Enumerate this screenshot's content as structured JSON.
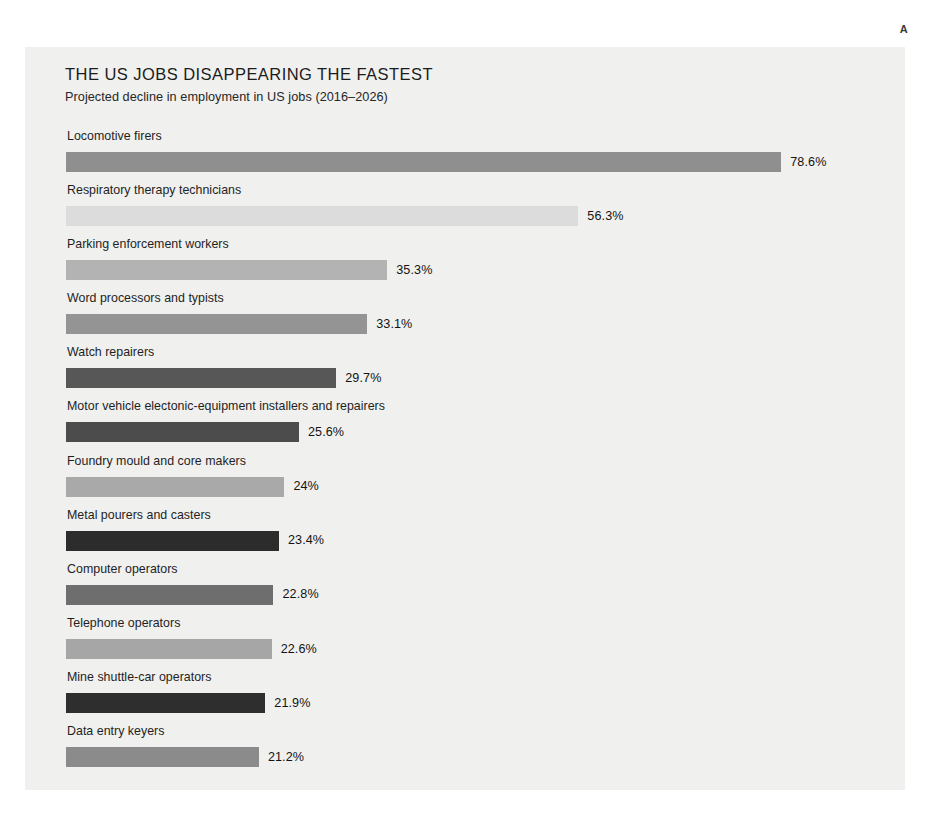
{
  "corner_marker": "A",
  "chart_data": {
    "type": "bar",
    "orientation": "horizontal",
    "title": "THE US JOBS DISAPPEARING THE FASTEST",
    "subtitle": "Projected decline in employment in US jobs (2016–2026)",
    "xlabel": "",
    "ylabel": "",
    "grid": false,
    "legend": "none",
    "value_suffix": "%",
    "xlim": [
      0,
      78.6
    ],
    "categories": [
      "Locomotive firers",
      "Respiratory therapy technicians",
      "Parking enforcement workers",
      "Word processors and typists",
      "Watch repairers",
      "Motor vehicle electonic-equipment installers and repairers",
      "Foundry mould and core makers",
      "Metal pourers and casters",
      "Computer operators",
      "Telephone operators",
      "Mine shuttle-car operators",
      "Data entry keyers"
    ],
    "values": [
      78.6,
      56.3,
      35.3,
      33.1,
      29.7,
      25.6,
      24,
      23.4,
      22.8,
      22.6,
      21.9,
      21.2
    ],
    "value_labels": [
      "78.6%",
      "56.3%",
      "35.3%",
      "33.1%",
      "29.7%",
      "25.6%",
      "24%",
      "23.4%",
      "22.8%",
      "22.6%",
      "21.9%",
      "21.2%"
    ],
    "bar_colors": [
      "#8f8f8f",
      "#dcdcdc",
      "#b3b3b3",
      "#949494",
      "#575757",
      "#4c4c4c",
      "#a9a9a9",
      "#2c2c2c",
      "#6e6e6e",
      "#a6a6a6",
      "#2e2e2e",
      "#8b8b8b"
    ],
    "bars": [
      {
        "label": "Locomotive firers",
        "value": 78.6,
        "value_label": "78.6%",
        "color": "#8f8f8f"
      },
      {
        "label": "Respiratory therapy technicians",
        "value": 56.3,
        "value_label": "56.3%",
        "color": "#dcdcdc"
      },
      {
        "label": "Parking enforcement workers",
        "value": 35.3,
        "value_label": "35.3%",
        "color": "#b3b3b3"
      },
      {
        "label": "Word processors and typists",
        "value": 33.1,
        "value_label": "33.1%",
        "color": "#949494"
      },
      {
        "label": "Watch repairers",
        "value": 29.7,
        "value_label": "29.7%",
        "color": "#575757"
      },
      {
        "label": "Motor vehicle electonic-equipment installers and repairers",
        "value": 25.6,
        "value_label": "25.6%",
        "color": "#4c4c4c"
      },
      {
        "label": "Foundry mould and core makers",
        "value": 24,
        "value_label": "24%",
        "color": "#a9a9a9"
      },
      {
        "label": "Metal pourers and casters",
        "value": 23.4,
        "value_label": "23.4%",
        "color": "#2c2c2c"
      },
      {
        "label": "Computer operators",
        "value": 22.8,
        "value_label": "22.8%",
        "color": "#6e6e6e"
      },
      {
        "label": "Telephone operators",
        "value": 22.6,
        "value_label": "22.6%",
        "color": "#a6a6a6"
      },
      {
        "label": "Mine shuttle-car operators",
        "value": 21.9,
        "value_label": "21.9%",
        "color": "#2e2e2e"
      },
      {
        "label": "Data entry keyers",
        "value": 21.2,
        "value_label": "21.2%",
        "color": "#8b8b8b"
      }
    ]
  },
  "style": {
    "page_background": "#ffffff",
    "card_background": "#f0f0ee",
    "text_color": "#1c1c1c",
    "px_per_percent": 9.1
  }
}
